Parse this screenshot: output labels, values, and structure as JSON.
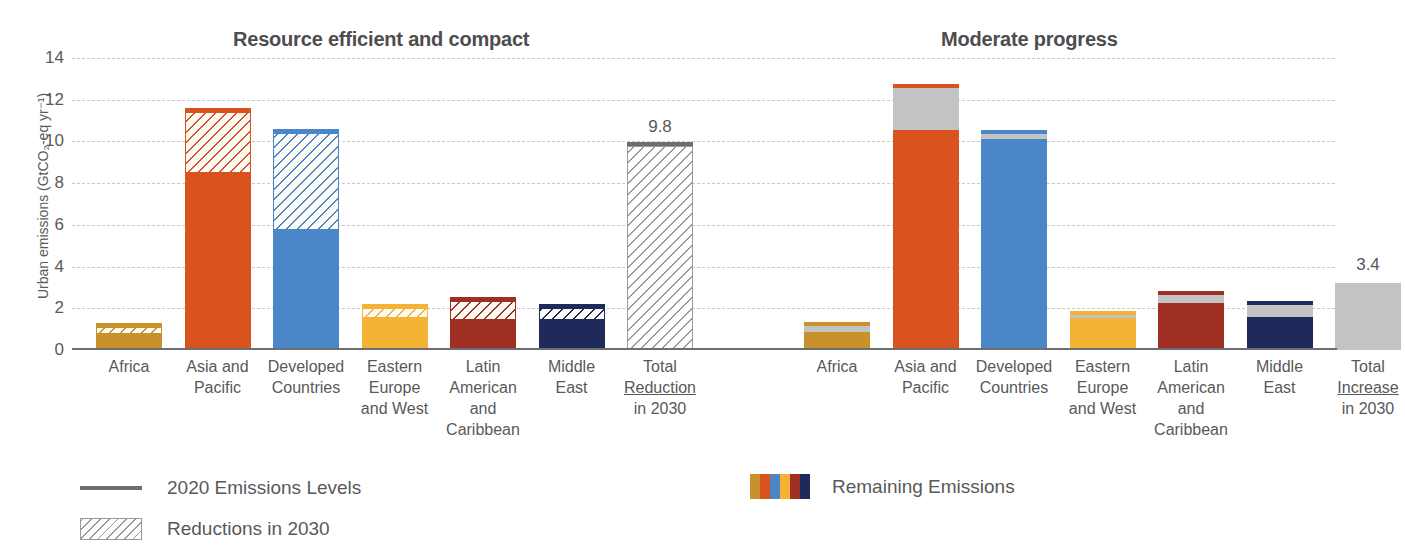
{
  "panels": {
    "left": {
      "title": "Resource efficient and compact"
    },
    "right": {
      "title": "Moderate progress"
    }
  },
  "axis": {
    "ylabel": "Urban emissions (GtCO₂-eq yr⁻¹)",
    "yticks": [
      "14",
      "12",
      "10",
      "8",
      "6",
      "4",
      "2",
      "0"
    ]
  },
  "legend": {
    "line_label": "2020 Emissions Levels",
    "hatch_label": "Reductions in 2030",
    "remaining_label": "Remaining Emissions",
    "remaining_colors": [
      "#c8922a",
      "#d9531e",
      "#4a86c8",
      "#f5b335",
      "#9e2f22",
      "#1f2a5a"
    ]
  },
  "colors": {
    "africa": "#c8922a",
    "asia_pacific": "#d9531e",
    "developed": "#4a86c8",
    "eastern_europe": "#f5b335",
    "latin_america": "#9e2f22",
    "middle_east": "#1f2a5a",
    "total_gray": "#c3c3c3",
    "axis": "#6d6e71",
    "grid": "#c9c9c9",
    "text": "#58595b"
  },
  "chart_data": {
    "type": "bar",
    "xlabel": "",
    "ylabel": "Urban emissions (GtCO2-eq yr-1)",
    "ylim": [
      0,
      14
    ],
    "ytick_values": [
      0,
      2,
      4,
      6,
      8,
      10,
      12,
      14
    ],
    "grid": true,
    "legend_position": "bottom",
    "stacking": "remaining emissions (solid) + change in 2030 (hatched / gray), capped by 2020 emissions level line",
    "panels": [
      {
        "name": "Resource efficient and compact",
        "change_type": "reduction",
        "change_style": "hatched",
        "categories": [
          "Africa",
          "Asia and Pacific",
          "Developed Countries",
          "Eastern Europe and West",
          "Latin American and Caribbean",
          "Middle East",
          "Total Reduction in 2030"
        ],
        "series": [
          {
            "name": "Remaining Emissions",
            "values": [
              0.75,
              8.5,
              5.75,
              1.55,
              1.45,
              1.45,
              0.0
            ]
          },
          {
            "name": "Reductions in 2030",
            "values": [
              0.35,
              2.9,
              4.65,
              0.45,
              0.9,
              0.55,
              9.8
            ]
          }
        ],
        "emissions_2020_level": [
          1.1,
          11.4,
          10.4,
          2.0,
          2.35,
          2.0,
          9.85
        ],
        "data_labels": {
          "Total Reduction in 2030": "9.8"
        }
      },
      {
        "name": "Moderate progress",
        "change_type": "increase",
        "change_style": "solid-gray",
        "categories": [
          "Africa",
          "Asia and Pacific",
          "Developed Countries",
          "Eastern Europe and West",
          "Latin American and Caribbean",
          "Middle East",
          "Total Increase in 2030"
        ],
        "series": [
          {
            "name": "Remaining Emissions",
            "values": [
              0.85,
              10.55,
              10.1,
              1.55,
              2.25,
              1.6,
              0.0
            ]
          },
          {
            "name": "Increase in 2030",
            "values": [
              0.3,
              2.0,
              0.25,
              0.12,
              0.4,
              0.55,
              3.2
            ]
          }
        ],
        "emissions_2020_level": [
          1.15,
          12.55,
          10.35,
          1.67,
          2.65,
          2.15,
          3.2
        ],
        "data_labels": {
          "Total Increase in 2030": "3.4"
        }
      }
    ]
  }
}
